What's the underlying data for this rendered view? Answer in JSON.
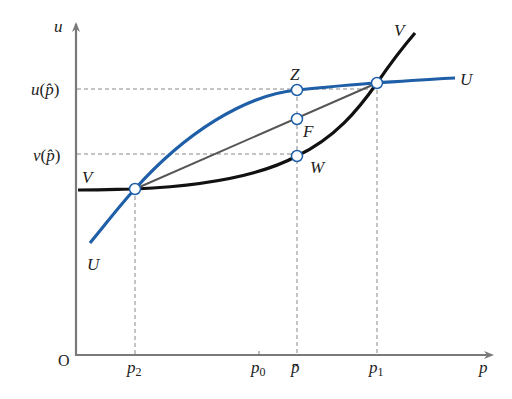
{
  "figure": {
    "axes": {
      "y_label": "u",
      "x_label": "p",
      "origin_label": "O"
    },
    "y_ticks": [
      {
        "label_fn": "u",
        "label_arg": "p̂",
        "y": 89
      },
      {
        "label_fn": "v",
        "label_arg": "p̂",
        "y": 154
      }
    ],
    "x_ticks": [
      {
        "label": "p",
        "sub": "2",
        "x": 135
      },
      {
        "label": "p",
        "sub": "0",
        "x": 259
      },
      {
        "label": "p̄",
        "sub": "",
        "x": 297
      },
      {
        "label": "p",
        "sub": "1",
        "x": 377
      }
    ],
    "curves": [
      {
        "name": "U",
        "color": "#1f5fa8",
        "label_start": "U",
        "label_end": "U"
      },
      {
        "name": "V",
        "color": "#111111",
        "label_start": "V",
        "label_end": "V"
      }
    ],
    "chord": {
      "color": "#555555"
    },
    "points": [
      {
        "name": "Z",
        "label": "Z"
      },
      {
        "name": "F",
        "label": "F"
      },
      {
        "name": "W",
        "label": "W"
      }
    ],
    "colors": {
      "axis": "#7a7a7a",
      "guide": "#888888",
      "u_curve": "#1f5fa8",
      "v_curve": "#111111",
      "chord": "#555555"
    }
  }
}
